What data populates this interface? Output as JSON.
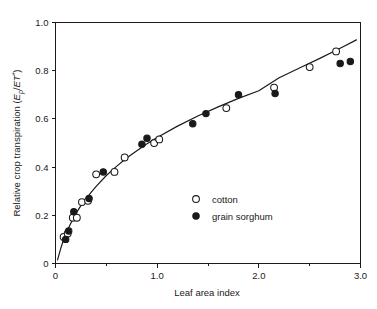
{
  "chart_data": {
    "type": "scatter",
    "title": "",
    "xlabel": "Leaf area index",
    "ylabel": "Relative crop transpiration (Ep/ET*)",
    "ylabel_parts": {
      "prefix": "Relative crop transpiration (",
      "var_main": "E",
      "var_sub": "p",
      "slash": "/",
      "denom": "ET",
      "denom_sup": "*",
      "suffix": ")"
    },
    "xlim": [
      0,
      3.0
    ],
    "ylim": [
      0,
      1.0
    ],
    "grid": false,
    "xticks": [
      0,
      1.0,
      2.0,
      3.0
    ],
    "xticklabels": [
      "0",
      "1.0",
      "2.0",
      "3.0"
    ],
    "xminorticks": [
      0.5,
      1.5,
      2.5
    ],
    "yticks": [
      0,
      0.2,
      0.4,
      0.6,
      0.8,
      1.0
    ],
    "yticklabels": [
      "0",
      "0.2",
      "0.4",
      "0.6",
      "0.8",
      "1.0"
    ],
    "legend_position": "center",
    "series": [
      {
        "name": "cotton",
        "marker": "open-circle",
        "color": "#1a1a1a",
        "points": [
          [
            0.08,
            0.11
          ],
          [
            0.12,
            0.125
          ],
          [
            0.17,
            0.19
          ],
          [
            0.21,
            0.19
          ],
          [
            0.26,
            0.255
          ],
          [
            0.32,
            0.26
          ],
          [
            0.4,
            0.37
          ],
          [
            0.58,
            0.38
          ],
          [
            0.68,
            0.44
          ],
          [
            0.97,
            0.5
          ],
          [
            1.02,
            0.515
          ],
          [
            1.68,
            0.645
          ],
          [
            2.15,
            0.73
          ],
          [
            2.5,
            0.815
          ],
          [
            2.76,
            0.88
          ]
        ]
      },
      {
        "name": "grain sorghum",
        "marker": "filled-circle",
        "color": "#1a1a1a",
        "points": [
          [
            0.1,
            0.1
          ],
          [
            0.13,
            0.135
          ],
          [
            0.18,
            0.215
          ],
          [
            0.33,
            0.27
          ],
          [
            0.47,
            0.38
          ],
          [
            0.85,
            0.495
          ],
          [
            0.9,
            0.52
          ],
          [
            1.35,
            0.58
          ],
          [
            1.48,
            0.622
          ],
          [
            1.8,
            0.7
          ],
          [
            2.16,
            0.705
          ],
          [
            2.8,
            0.83
          ],
          [
            2.9,
            0.838
          ]
        ]
      }
    ],
    "fit_curve": {
      "description": "monotonic saturating fit through data",
      "points": [
        [
          0.02,
          0.015
        ],
        [
          0.05,
          0.06
        ],
        [
          0.08,
          0.1
        ],
        [
          0.12,
          0.14
        ],
        [
          0.16,
          0.175
        ],
        [
          0.2,
          0.207
        ],
        [
          0.25,
          0.24
        ],
        [
          0.3,
          0.268
        ],
        [
          0.35,
          0.295
        ],
        [
          0.4,
          0.32
        ],
        [
          0.5,
          0.365
        ],
        [
          0.6,
          0.403
        ],
        [
          0.7,
          0.438
        ],
        [
          0.8,
          0.468
        ],
        [
          0.9,
          0.497
        ],
        [
          1.0,
          0.523
        ],
        [
          1.2,
          0.57
        ],
        [
          1.4,
          0.612
        ],
        [
          1.6,
          0.65
        ],
        [
          1.8,
          0.685
        ],
        [
          2.0,
          0.717
        ],
        [
          2.2,
          0.771
        ],
        [
          2.4,
          0.811
        ],
        [
          2.6,
          0.851
        ],
        [
          2.8,
          0.893
        ],
        [
          2.96,
          0.928
        ]
      ]
    },
    "legend": [
      {
        "label": "cotton",
        "marker": "open-circle"
      },
      {
        "label": "grain sorghum",
        "marker": "filled-circle"
      }
    ]
  }
}
